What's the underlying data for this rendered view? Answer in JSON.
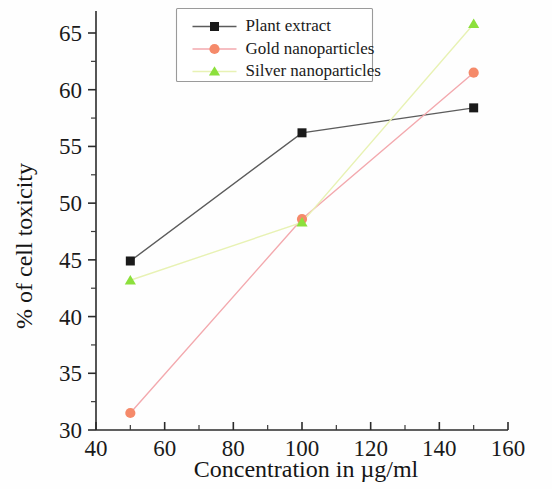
{
  "chart_data": {
    "type": "line",
    "title": "",
    "xlabel": "Concentration in µg/ml",
    "ylabel": "% of cell toxicity",
    "x": [
      50,
      100,
      150
    ],
    "xlim": [
      40,
      160
    ],
    "ylim": [
      30,
      67
    ],
    "xticks": [
      40,
      60,
      80,
      100,
      120,
      140,
      160
    ],
    "xticklabels": [
      "40",
      "60",
      "80",
      "100",
      "120",
      "140",
      "160"
    ],
    "yticks": [
      30,
      35,
      40,
      45,
      50,
      55,
      60,
      65
    ],
    "yticklabels": [
      "30",
      "35",
      "40",
      "45",
      "50",
      "55",
      "60",
      "65"
    ],
    "x_minor_step": 10,
    "y_minor_step": 2.5,
    "grid": false,
    "legend_position": "top-center",
    "series": [
      {
        "name": "Plant extract",
        "marker": "square",
        "marker_color": "#1a1a1a",
        "line_color": "#5c5c5c",
        "values": [
          44.9,
          56.2,
          58.4
        ]
      },
      {
        "name": "Gold nanoparticles",
        "marker": "circle",
        "marker_color": "#f58a6a",
        "line_color": "#f3a9ae",
        "values": [
          31.5,
          48.6,
          61.5
        ]
      },
      {
        "name": "Silver nanoparticles",
        "marker": "triangle",
        "marker_color": "#8ce03c",
        "line_color": "#e8f2b4",
        "values": [
          43.2,
          48.3,
          65.8
        ]
      }
    ]
  },
  "legend": {
    "entries": [
      {
        "label": "Plant extract"
      },
      {
        "label": "Gold nanoparticles"
      },
      {
        "label": "Silver nanoparticles"
      }
    ]
  }
}
